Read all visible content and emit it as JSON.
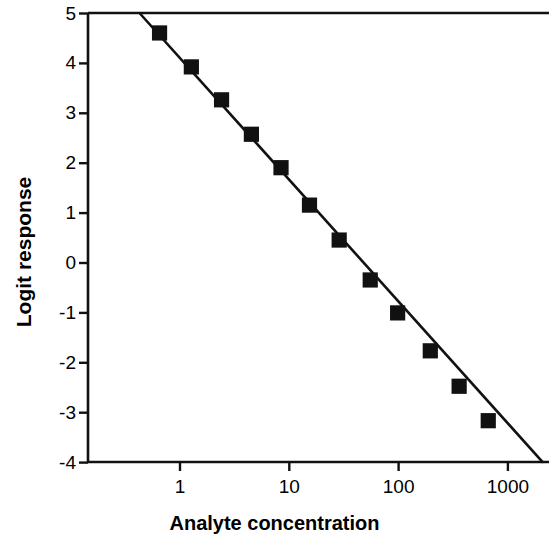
{
  "chart_data": {
    "type": "scatter",
    "title": "",
    "xlabel": "Analyte concentration",
    "ylabel": "Logit response",
    "xscale": "log",
    "yscale": "linear",
    "xlim": [
      0.42,
      2100
    ],
    "ylim": [
      -4,
      5
    ],
    "xticks": [
      1,
      10,
      100,
      1000
    ],
    "xtick_labels": [
      "1",
      "10",
      "100",
      "1000"
    ],
    "yticks": [
      5,
      4,
      3,
      2,
      1,
      0,
      -1,
      -2,
      -3,
      -4
    ],
    "ytick_labels": [
      "5",
      "4",
      "3",
      "2",
      "1",
      "0",
      "-1",
      "-2",
      "-3",
      "-4"
    ],
    "grid": false,
    "legend": null,
    "series": [
      {
        "name": "Logit-log calibration",
        "marker": "square",
        "marker_color": "#111111",
        "line_color": "#111111",
        "points": [
          {
            "x": 0.65,
            "y": 4.61
          },
          {
            "x": 1.27,
            "y": 3.93
          },
          {
            "x": 2.4,
            "y": 3.27
          },
          {
            "x": 4.5,
            "y": 2.58
          },
          {
            "x": 8.4,
            "y": 1.91
          },
          {
            "x": 15.3,
            "y": 1.16
          },
          {
            "x": 28.6,
            "y": 0.46
          },
          {
            "x": 55.0,
            "y": -0.34
          },
          {
            "x": 98.0,
            "y": -1.0
          },
          {
            "x": 195.0,
            "y": -1.76
          },
          {
            "x": 358.0,
            "y": -2.47
          },
          {
            "x": 661.0,
            "y": -3.16
          }
        ],
        "fit_line": {
          "x_start": 0.43,
          "y_start": 5.0,
          "x_end": 2100.0,
          "y_end": -4.0
        }
      }
    ],
    "annotations": [],
    "frame": {
      "top": true,
      "left": true,
      "bottom": true,
      "right": false
    }
  },
  "axes": {
    "y_axis_title": "Logit response",
    "x_axis_title": "Analyte concentration"
  }
}
